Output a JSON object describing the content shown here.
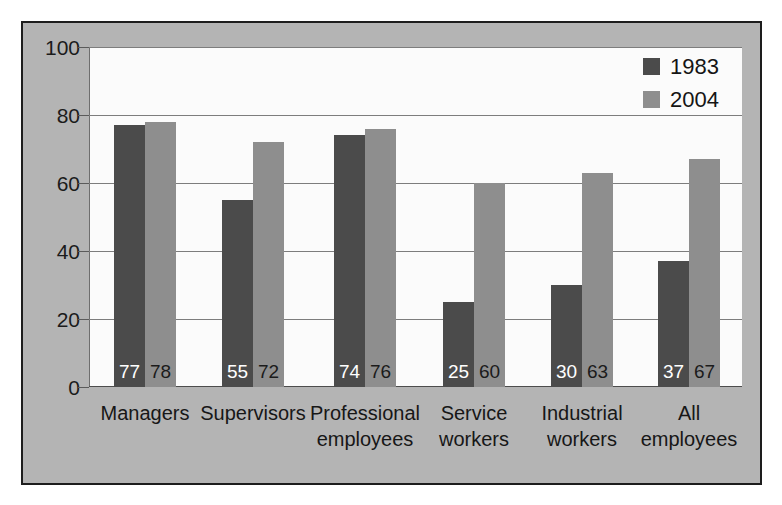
{
  "chart_data": {
    "type": "bar",
    "title": "",
    "subtitle": "",
    "xlabel": "",
    "ylabel": "",
    "ylim": [
      0,
      100
    ],
    "yticks": [
      0,
      20,
      40,
      60,
      80,
      100
    ],
    "grid": true,
    "legend_position": "top-right",
    "categories": [
      "Managers",
      "Supervisors",
      "Professional\nemployees",
      "Service\nworkers",
      "Industrial\nworkers",
      "All\nemployees"
    ],
    "series": [
      {
        "name": "1983",
        "color": "#4b4b4b",
        "values": [
          77,
          55,
          74,
          25,
          30,
          37
        ]
      },
      {
        "name": "2004",
        "color": "#8e8e8e",
        "values": [
          78,
          72,
          76,
          60,
          63,
          67
        ]
      }
    ]
  },
  "legend": {
    "items": [
      {
        "label": "1983",
        "swatch": "legend-swatch-1983"
      },
      {
        "label": "2004",
        "swatch": "legend-swatch-2004"
      }
    ]
  },
  "axis": {
    "y_tick_labels": [
      "100",
      "80",
      "60",
      "40",
      "20",
      "0"
    ]
  }
}
